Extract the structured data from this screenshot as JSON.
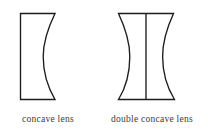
{
  "figure": {
    "background_color": "#ffffff",
    "stroke_color": "#1c1c1c",
    "label_color": "#3b3b3b",
    "items": [
      {
        "id": "concave-lens",
        "label": "concave lens",
        "shape": "plano-concave",
        "description": "Rectangular lens outline with a flat left surface and a concave right surface",
        "bounds": {
          "x": 20,
          "y": 13,
          "width": 35,
          "height": 87
        },
        "curve_depth_px": 11,
        "surfaces": {
          "left": "flat",
          "right": "concave"
        },
        "center_line": false
      },
      {
        "id": "double-concave-lens",
        "label": "double concave lens",
        "shape": "bi-concave",
        "description": "Hourglass lens outline with flat top and bottom edges and two concave side surfaces, with a vertical optical axis line through the centre",
        "bounds": {
          "x": 118,
          "y": 13,
          "width": 58,
          "height": 87
        },
        "curve_depth_px": 11,
        "surfaces": {
          "left": "concave",
          "right": "concave"
        },
        "center_line": true,
        "center_line_x": 146
      }
    ]
  }
}
